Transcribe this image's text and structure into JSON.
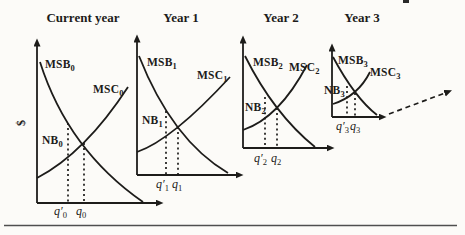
{
  "figure": {
    "ink_color": "#1d1c1a",
    "background_color": "#fcfbf8",
    "divider_color": "#4f4f4f",
    "panels": [
      {
        "title": "Current year",
        "y_axis_label": "$",
        "msb": {
          "base": "MSB",
          "sub": "0"
        },
        "msc": {
          "base": "MSC",
          "sub": "0"
        },
        "nb": {
          "base": "NB",
          "sub": "0"
        },
        "q_prime": {
          "base": "q′",
          "sub": "0"
        },
        "q": {
          "base": "q",
          "sub": "0"
        }
      },
      {
        "title": "Year 1",
        "msb": {
          "base": "MSB",
          "sub": "1"
        },
        "msc": {
          "base": "MSC",
          "sub": "1"
        },
        "nb": {
          "base": "NB",
          "sub": "1"
        },
        "q_prime": {
          "base": "q′",
          "sub": "1"
        },
        "q": {
          "base": "q",
          "sub": "1"
        }
      },
      {
        "title": "Year 2",
        "msb": {
          "base": "MSB",
          "sub": "2"
        },
        "msc": {
          "base": "MSC",
          "sub": "2"
        },
        "nb": {
          "base": "NB",
          "sub": "2"
        },
        "q_prime": {
          "base": "q′",
          "sub": "2"
        },
        "q": {
          "base": "q",
          "sub": "2"
        }
      },
      {
        "title": "Year 3",
        "msb": {
          "base": "MSB",
          "sub": "3"
        },
        "msc": {
          "base": "MSC",
          "sub": "3"
        },
        "nb": {
          "base": "NB",
          "sub": "3"
        },
        "q_prime": {
          "base": "q′",
          "sub": "3"
        },
        "q": {
          "base": "q",
          "sub": "3"
        }
      }
    ]
  }
}
